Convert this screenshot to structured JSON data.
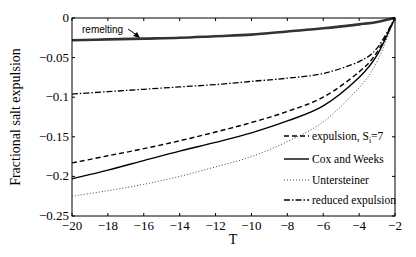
{
  "chart_data": {
    "type": "line",
    "title": "",
    "xlabel": "T",
    "ylabel": "Fractional salt expulsion",
    "xlim": [
      -20,
      -2
    ],
    "ylim": [
      -0.25,
      0
    ],
    "grid": false,
    "legend_position": "lower right",
    "x_ticks": [
      -20,
      -18,
      -16,
      -14,
      -12,
      -10,
      -8,
      -6,
      -4,
      -2
    ],
    "x_tick_labels": [
      "−20",
      "−18",
      "−16",
      "−14",
      "−12",
      "−10",
      "−8",
      "−6",
      "−4",
      "−2"
    ],
    "y_ticks": [
      0,
      -0.05,
      -0.1,
      -0.15,
      -0.2,
      -0.25
    ],
    "y_tick_labels": [
      "0",
      "−0.05",
      "−0.1",
      "−0.15",
      "−0.2",
      "−0.25"
    ],
    "x": [
      -20,
      -18,
      -16,
      -14,
      -12,
      -10,
      -8,
      -6,
      -4,
      -3,
      -2
    ],
    "series": [
      {
        "name": "remelting",
        "style": "solid-thick",
        "values": [
          -0.028,
          -0.027,
          -0.026,
          -0.025,
          -0.023,
          -0.021,
          -0.017,
          -0.013,
          -0.008,
          -0.005,
          0
        ],
        "in_legend": false
      },
      {
        "name": "reduced expulsion",
        "style": "dashdot",
        "values": [
          -0.096,
          -0.093,
          -0.09,
          -0.087,
          -0.084,
          -0.08,
          -0.076,
          -0.07,
          -0.055,
          -0.038,
          0
        ]
      },
      {
        "name": "expulsion, S_i=7",
        "style": "dashed",
        "values": [
          -0.183,
          -0.174,
          -0.165,
          -0.155,
          -0.144,
          -0.132,
          -0.118,
          -0.1,
          -0.068,
          -0.043,
          0
        ]
      },
      {
        "name": "Cox and Weeks",
        "style": "solid",
        "values": [
          -0.203,
          -0.192,
          -0.18,
          -0.168,
          -0.157,
          -0.145,
          -0.13,
          -0.111,
          -0.075,
          -0.047,
          0
        ]
      },
      {
        "name": "Untersteiner",
        "style": "dotted",
        "values": [
          -0.225,
          -0.218,
          -0.21,
          -0.2,
          -0.188,
          -0.175,
          -0.156,
          -0.131,
          -0.088,
          -0.055,
          0
        ]
      }
    ],
    "annotations": [
      {
        "text": "remelting",
        "arrow": true,
        "x": -19,
        "y": -0.02
      }
    ],
    "legend": [
      "expulsion, S_i=7",
      "Cox and Weeks",
      "Untersteiner",
      "reduced expulsion"
    ]
  },
  "labels": {
    "xlabel": "T",
    "ylabel": "Fractional salt expulsion",
    "annotation": "remelting",
    "legend": {
      "l1": "expulsion, S",
      "l1_sub": "i",
      "l1_tail": "=7",
      "l2": "Cox and Weeks",
      "l3": "Untersteiner",
      "l4": "reduced expulsion"
    }
  }
}
